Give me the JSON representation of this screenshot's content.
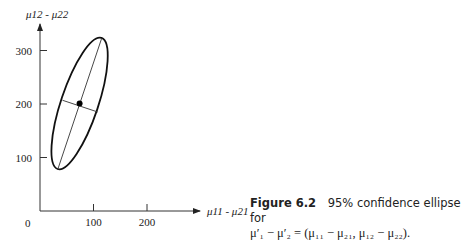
{
  "chart_data": {
    "type": "scatter",
    "xlabel": "μ11 - μ21",
    "ylabel": "μ12 - μ22",
    "xlim": [
      0,
      300
    ],
    "ylim": [
      0,
      340
    ],
    "x_ticks": [
      100,
      200
    ],
    "y_ticks": [
      100,
      200,
      300
    ],
    "origin_label": "0",
    "grid": false,
    "ellipse": {
      "center": [
        74,
        201
      ],
      "major_axis_endpoints": [
        [
          115,
          322
        ],
        [
          33,
          77
        ]
      ],
      "minor_axis_endpoints": [
        [
          42,
          207
        ],
        [
          108,
          185
        ]
      ]
    },
    "points": [
      {
        "name": "center",
        "x": 74,
        "y": 201
      }
    ]
  },
  "caption": {
    "figure_label": "Figure 6.2",
    "text": "95% confidence ellipse for",
    "equation_line": "μ′₁ − μ′₂ = (μ₁₁ − μ₂₁, μ₁₂ − μ₂₂)."
  }
}
